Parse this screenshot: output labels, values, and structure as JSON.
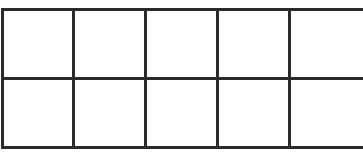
{
  "diagram": {
    "type": "empty-grid",
    "rows": 2,
    "columns": 5,
    "line_color": "#2b2b2b",
    "background": "#ffffff",
    "cells": [
      [
        "",
        "",
        "",
        "",
        ""
      ],
      [
        "",
        "",
        "",
        "",
        ""
      ]
    ]
  }
}
